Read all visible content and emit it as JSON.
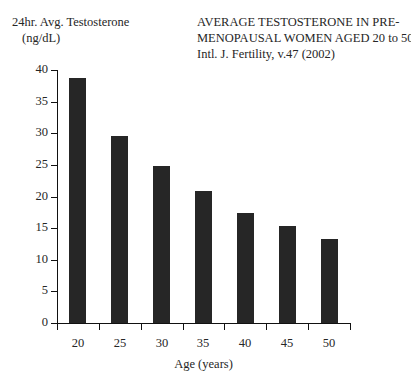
{
  "y_axis_caption": {
    "line1": "24hr. Avg. Testosterone",
    "line2": "(ng/dL)"
  },
  "title": {
    "line1": "AVERAGE TESTOSTERONE IN PRE-",
    "line2": "MENOPAUSAL WOMEN AGED 20 to 50",
    "line3": "Intl. J. Fertility, v.47 (2002)"
  },
  "colors": {
    "bar": "#262626",
    "axis": "#111111",
    "background": "#ffffff",
    "text": "#262626"
  },
  "chart_data": {
    "type": "bar",
    "subtitle": "Intl. J. Fertility, v.47 (2002)",
    "xlabel": "Age (years)",
    "ylabel": "24hr. Avg. Testosterone (ng/dL)",
    "categories": [
      "20",
      "25",
      "30",
      "35",
      "40",
      "45",
      "50"
    ],
    "values": [
      38.7,
      29.6,
      24.9,
      20.8,
      17.4,
      15.3,
      13.3
    ],
    "ylim": [
      0,
      40
    ],
    "yticks": [
      "0",
      "5",
      "10",
      "15",
      "20",
      "25",
      "30",
      "35",
      "40"
    ],
    "xticks": [
      "20",
      "25",
      "30",
      "35",
      "40",
      "45",
      "50"
    ],
    "grid": false,
    "legend": false
  }
}
